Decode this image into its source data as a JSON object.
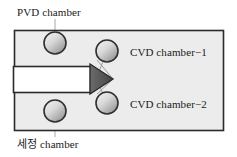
{
  "diagram": {
    "colors": {
      "outline": "#2b2b2b",
      "container_fill": "#ebebeb",
      "chamber_fill_light": "#f2f2f2",
      "chamber_fill_dark": "#9a9a9a",
      "chamber_stroke": "#333333",
      "arrow_fill": "#555555",
      "transfer_fill": "#ffffff",
      "connector": "#8c8c8c",
      "leader": "#9a9a9a",
      "text": "#1a1a1a"
    },
    "labels": {
      "pvd_chamber": "PVD chamber",
      "cleaning_chamber": "세정 chamber",
      "cvd_chamber_1": "CVD chamber−1",
      "cvd_chamber_2": "CVD chamber−2"
    },
    "container": {
      "x": 14,
      "y": 30,
      "width": 210,
      "height": 101
    },
    "transfer_bar": {
      "x": 14,
      "y": 66,
      "width": 76,
      "height": 26
    },
    "arrow": {
      "tip_x": 113,
      "base_x": 90,
      "top_y": 64,
      "bottom_y": 94
    },
    "chambers": [
      {
        "name": "pvd-chamber",
        "cx": 55,
        "cy": 43,
        "r": 11
      },
      {
        "name": "cleaning-chamber",
        "cx": 55,
        "cy": 111,
        "r": 11
      },
      {
        "name": "cvd-chamber-1",
        "cx": 107,
        "cy": 51,
        "r": 11
      },
      {
        "name": "cvd-chamber-2",
        "cx": 107,
        "cy": 103,
        "r": 11
      }
    ]
  }
}
